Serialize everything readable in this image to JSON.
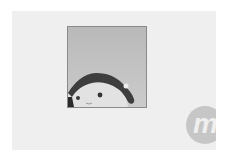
{
  "card": {
    "background": "#efefef",
    "thumbnail": {
      "alt": "plush doll photo",
      "subject": "plush doll head with dark hair",
      "tone": "grayscale"
    },
    "logo": {
      "glyph": "m",
      "icon": "brand-logo-icon",
      "color": "#c6c6c6"
    }
  }
}
